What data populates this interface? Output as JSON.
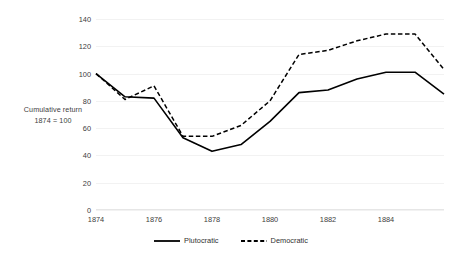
{
  "chart_data": {
    "type": "line",
    "title": "",
    "subtitle": "",
    "ylabel_line1": "Cumulative return",
    "ylabel_line2": "1874 = 100",
    "xlabel": "",
    "x": [
      1874,
      1875,
      1876,
      1877,
      1878,
      1879,
      1880,
      1881,
      1882,
      1883,
      1884,
      1885,
      1886
    ],
    "xtick_labels": [
      "1874",
      "1876",
      "1878",
      "1880",
      "1882",
      "1884"
    ],
    "xtick_values": [
      1874,
      1876,
      1878,
      1880,
      1882,
      1884
    ],
    "xlim": [
      1874,
      1886
    ],
    "ytick_labels": [
      "0",
      "20",
      "40",
      "60",
      "80",
      "100",
      "120",
      "140"
    ],
    "ytick_values": [
      0,
      20,
      40,
      60,
      80,
      100,
      120,
      140
    ],
    "ylim": [
      0,
      140
    ],
    "grid": true,
    "legend_position": "bottom",
    "series": [
      {
        "name": "Plutocratic",
        "style": "solid",
        "color": "#000000",
        "values": [
          100,
          83,
          82,
          53,
          43,
          48,
          65,
          86,
          88,
          96,
          101,
          101,
          85
        ]
      },
      {
        "name": "Democratic",
        "style": "dashed",
        "color": "#000000",
        "values": [
          100,
          81,
          91,
          54,
          54,
          62,
          80,
          114,
          117,
          124,
          129,
          129,
          103
        ]
      }
    ]
  }
}
